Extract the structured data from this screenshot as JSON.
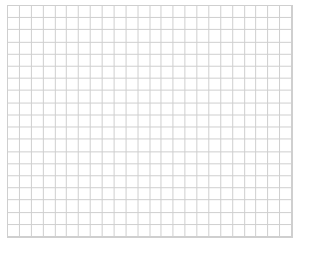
{
  "grid": {
    "left": 7,
    "top": 5,
    "width": 285,
    "height": 232,
    "columns": 24,
    "rows": 19,
    "line_color": "#cfcfcf",
    "background": "#ffffff"
  }
}
